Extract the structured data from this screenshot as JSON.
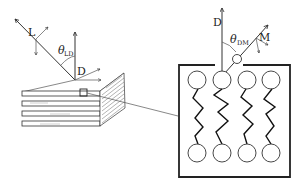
{
  "diagram": {
    "left_panel": {
      "vectors": [
        {
          "name": "L",
          "label": "L"
        },
        {
          "name": "D",
          "label": "D"
        }
      ],
      "angle": {
        "symbol": "θ",
        "subscript": "LD"
      },
      "object": "stacked lamellar bilayers with highlighted region"
    },
    "right_panel": {
      "vectors": [
        {
          "name": "D",
          "label": "D"
        },
        {
          "name": "M",
          "label": "M"
        }
      ],
      "angle": {
        "symbol": "θ",
        "subscript": "DM"
      },
      "object": "lipid bilayer magnified view",
      "head_groups_per_leaflet": 4
    }
  },
  "colors": {
    "line": "#333333",
    "background": "#ffffff"
  }
}
